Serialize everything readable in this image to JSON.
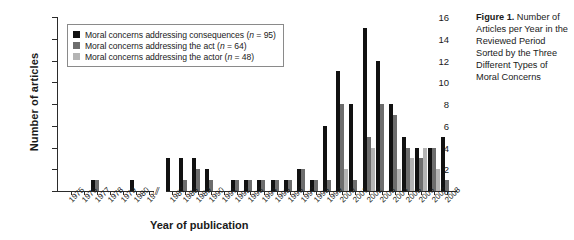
{
  "caption": {
    "label": "Figure 1.",
    "text": " Number of Articles per Year in the Reviewed Period Sorted by the Three Different Types of Moral Concerns"
  },
  "axes": {
    "ylabel": "Number of articles",
    "xlabel": "Year of publication",
    "yticks": [
      0,
      2,
      4,
      6,
      8,
      10,
      12,
      14,
      16
    ],
    "ylim": [
      0,
      16
    ],
    "break_symbol": "//",
    "break_after": "1981"
  },
  "legend": {
    "position": "top-left-inside",
    "items": [
      {
        "label": "Moral concerns addressing consequences (n = 95)",
        "color": "#111111",
        "n": 95
      },
      {
        "label": "Moral concerns addressing the act (n = 64)",
        "color": "#6d6d6d",
        "n": 64
      },
      {
        "label": "Moral concerns addressing the actor (n = 48)",
        "color": "#b4b4b4",
        "n": 48
      }
    ]
  },
  "chart_data": {
    "type": "bar",
    "title": "Number of Articles per Year in the Reviewed Period Sorted by the Three Different Types of Moral Concerns",
    "xlabel": "Year of publication",
    "ylabel": "Number of articles",
    "ylim": [
      0,
      16
    ],
    "grid": false,
    "legend_position": "upper left",
    "note": "x-axis has a break between 1981 and 1987",
    "categories": [
      "1975",
      "1976",
      "1977",
      "1978",
      "1979",
      "1980",
      "1981",
      "1987",
      "1988",
      "1989",
      "1990",
      "1991",
      "1992",
      "1993",
      "1994",
      "1995",
      "1996",
      "1997",
      "1998",
      "1999",
      "2000",
      "2001",
      "2002",
      "2003",
      "2004",
      "2005",
      "2006",
      "2007",
      "2008"
    ],
    "series": [
      {
        "name": "Moral concerns addressing consequences (n = 95)",
        "color": "#111111",
        "values": [
          0,
          0,
          1,
          0,
          0,
          1,
          0,
          3,
          3,
          3,
          2,
          0,
          1,
          1,
          1,
          1,
          1,
          2,
          1,
          6,
          11,
          8,
          15,
          12,
          8,
          5,
          4,
          4,
          5
        ]
      },
      {
        "name": "Moral concerns addressing the act (n = 64)",
        "color": "#6d6d6d",
        "values": [
          0,
          0,
          1,
          0,
          0,
          0,
          0,
          0,
          1,
          2,
          1,
          0,
          1,
          1,
          1,
          1,
          1,
          2,
          1,
          1,
          8,
          1,
          5,
          8,
          7,
          4,
          3,
          4,
          1
        ]
      },
      {
        "name": "Moral concerns addressing the actor (n = 48)",
        "color": "#b4b4b4",
        "values": [
          0,
          0,
          0,
          0,
          0,
          0,
          0,
          0,
          0,
          0,
          0,
          0,
          0,
          0,
          0,
          0,
          0,
          0,
          0,
          0,
          2,
          0,
          4,
          0,
          2,
          3,
          4,
          2,
          0
        ]
      }
    ]
  }
}
